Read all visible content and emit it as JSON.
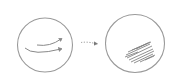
{
  "diagram": {
    "style": "pencil sketch",
    "stroke_color": "#8a8a8a",
    "shade_color": "#6e6e6e",
    "nodes": [
      {
        "id": "left-circle",
        "label": "",
        "content": "two curved motion arrows pointing right"
      },
      {
        "id": "right-circle",
        "label": "",
        "content": "shaded scribble in lower-right region"
      }
    ],
    "edges": [
      {
        "from": "left-circle",
        "to": "right-circle",
        "style": "dotted arrow",
        "label": ""
      }
    ]
  }
}
